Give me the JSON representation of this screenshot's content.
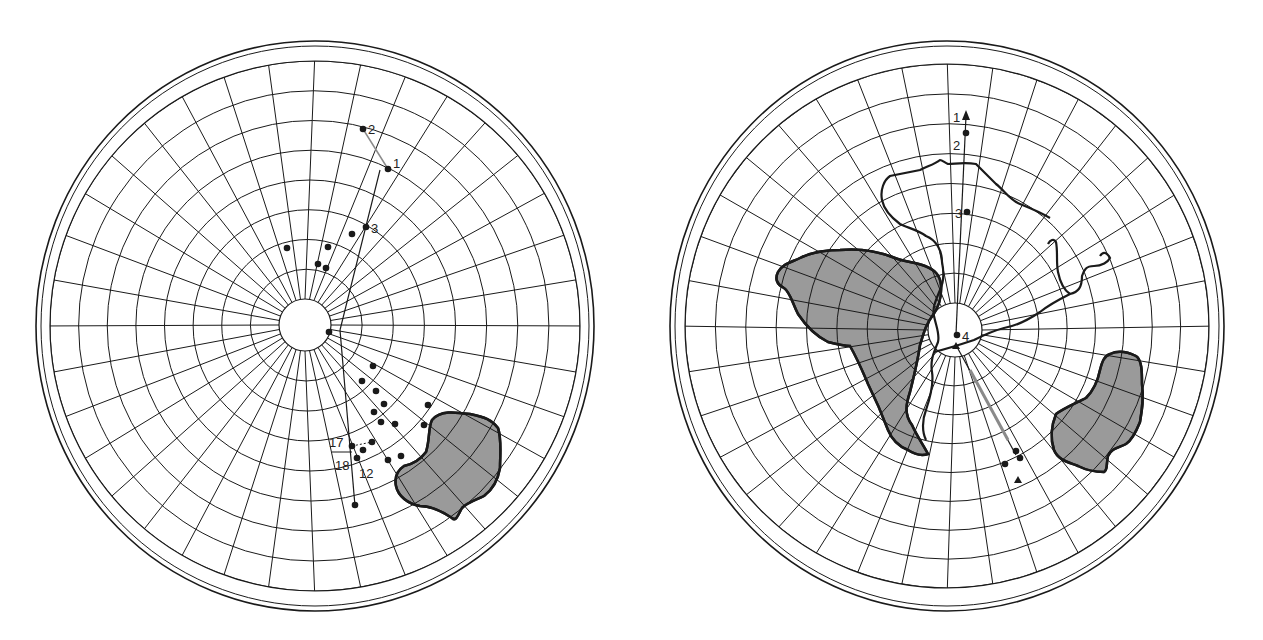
{
  "figure": {
    "colors": {
      "ink": "#1a1a1a",
      "land": "#9a9a9a",
      "path_gray": "#8a8a8a",
      "background": "#ffffff"
    },
    "left_globe": {
      "center": [
        315,
        326
      ],
      "rx": 278,
      "ry": 285,
      "grid_radius": 265,
      "hole_radius": 26,
      "hole_center": [
        305,
        325
      ],
      "labels": [
        {
          "text": "2",
          "x": 368,
          "y": 134
        },
        {
          "text": "1",
          "x": 393,
          "y": 168
        },
        {
          "text": "3",
          "x": 371,
          "y": 233
        },
        {
          "text": "17",
          "x": 329,
          "y": 447
        },
        {
          "text": "18",
          "x": 335,
          "y": 470
        },
        {
          "text": "12",
          "x": 359,
          "y": 478
        }
      ]
    },
    "right_globe": {
      "center": [
        947,
        326
      ],
      "rx": 276,
      "ry": 285,
      "grid_radius": 262,
      "hole_radius": 27,
      "hole_center": [
        955,
        330
      ],
      "labels": [
        {
          "text": "1",
          "x": 953,
          "y": 122
        },
        {
          "text": "2",
          "x": 953,
          "y": 150
        },
        {
          "text": "3",
          "x": 955,
          "y": 218
        },
        {
          "text": "4",
          "x": 962,
          "y": 341
        }
      ]
    }
  }
}
